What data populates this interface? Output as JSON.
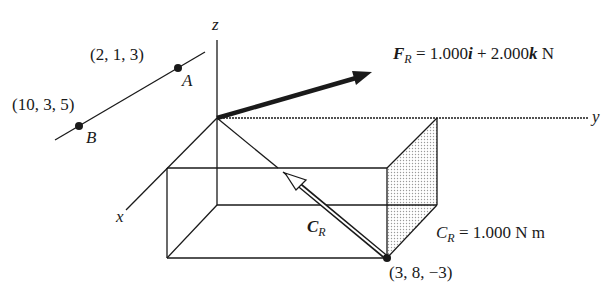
{
  "diagram": {
    "type": "3D statics force-couple system",
    "axes": {
      "x": "x",
      "y": "y",
      "z": "z"
    },
    "points": [
      {
        "name": "A",
        "coords": "(2, 1, 3)"
      },
      {
        "name": "B",
        "coords": "(10, 3, 5)"
      },
      {
        "name": "P",
        "coords": "(3, 8, −3)"
      }
    ],
    "force": {
      "symbol": "F",
      "subscript": "R",
      "equals": "=",
      "i_coef": "1.000",
      "i_unit": "i",
      "plus": "+",
      "k_coef": "2.000",
      "k_unit": "k",
      "unit": "N"
    },
    "couple": {
      "symbol": "C",
      "subscript": "R",
      "equals": "=",
      "magnitude": "1.000",
      "unit": "N m"
    },
    "colors": {
      "ink": "#1a1a1a",
      "shade": "#d8d8d8",
      "background": "#ffffff"
    }
  }
}
